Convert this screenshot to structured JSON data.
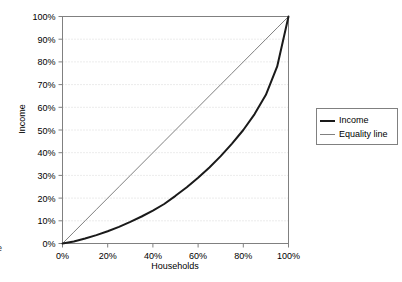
{
  "chart_data": {
    "type": "line",
    "title": "",
    "xlabel": "Households",
    "ylabel": "Income",
    "xlim": [
      0,
      100
    ],
    "ylim": [
      0,
      100
    ],
    "grid": true,
    "grid_axis": "y",
    "legend_position": "right",
    "x_ticks": [
      "0%",
      "20%",
      "40%",
      "60%",
      "80%",
      "100%"
    ],
    "x_tick_values": [
      0,
      20,
      40,
      60,
      80,
      100
    ],
    "y_ticks": [
      "0%",
      "10%",
      "20%",
      "30%",
      "40%",
      "50%",
      "60%",
      "70%",
      "80%",
      "90%",
      "100%"
    ],
    "y_tick_values": [
      0,
      10,
      20,
      30,
      40,
      50,
      60,
      70,
      80,
      90,
      100
    ],
    "x": [
      0,
      5,
      10,
      15,
      20,
      25,
      30,
      35,
      40,
      45,
      50,
      55,
      60,
      65,
      70,
      75,
      80,
      85,
      90,
      95,
      100
    ],
    "series": [
      {
        "name": "Income",
        "color": "#1a1a1a",
        "width": 2,
        "values": [
          0,
          0.9,
          2.2,
          3.7,
          5.4,
          7.3,
          9.5,
          11.9,
          14.5,
          17.4,
          21.0,
          24.8,
          29.0,
          33.5,
          38.5,
          44.0,
          50.0,
          57.0,
          65.5,
          78.0,
          100
        ]
      },
      {
        "name": "Equality line",
        "color": "#808080",
        "width": 1,
        "values": [
          0,
          5,
          10,
          15,
          20,
          25,
          30,
          35,
          40,
          45,
          50,
          55,
          60,
          65,
          70,
          75,
          80,
          85,
          90,
          95,
          100
        ]
      }
    ]
  },
  "legend": {
    "entries": [
      {
        "label": "Income"
      },
      {
        "label": "Equality line"
      }
    ]
  },
  "axes": {
    "x_title": "Households",
    "y_title": "Income"
  },
  "artifacts": {
    "left_edge_glyph": "e"
  },
  "colors": {
    "income_line": "#1a1a1a",
    "equality_line": "#808080",
    "plot_border": "#808080",
    "gridline": "#d8d8d8",
    "text": "#000000",
    "background": "#ffffff"
  }
}
